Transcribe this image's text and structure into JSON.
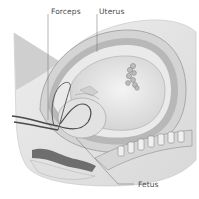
{
  "diagram": {
    "labels": [
      {
        "id": "forceps",
        "text": "Forceps"
      },
      {
        "id": "uterus",
        "text": "Uterus"
      },
      {
        "id": "fetus",
        "text": "Fetus"
      }
    ],
    "colors": {
      "background": "#ffffff",
      "label_text": "#4a4a4a",
      "leader_line": "#6a6a6a",
      "tissue_light": "#e6e6e6",
      "tissue_mid": "#c8c8c8",
      "tissue_dark": "#8c8c8c",
      "outline": "#5a5a5a"
    }
  }
}
